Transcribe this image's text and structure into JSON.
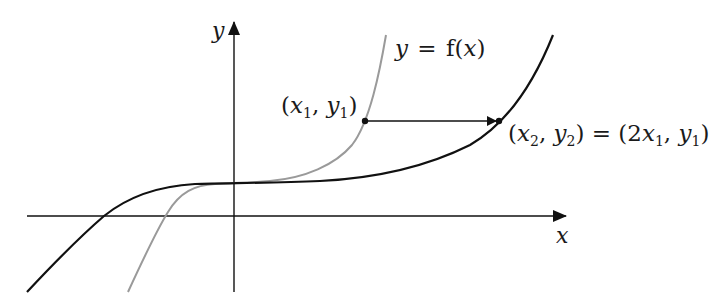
{
  "diagram": {
    "type": "function-graph",
    "axes": {
      "x_label": "x",
      "y_label": "y",
      "origin_px": [
        234,
        216
      ]
    },
    "curves": [
      {
        "name": "f(2x) curve",
        "color": "#9a9a9a",
        "label": "y = f(x)"
      },
      {
        "name": "stretched curve",
        "color": "#111111"
      }
    ],
    "annotations": {
      "curve_label": {
        "y": "y",
        "eq": "=",
        "f": "f(",
        "x": "x",
        "close": ")"
      },
      "point1": {
        "open": "(",
        "x": "x",
        "xs": "1",
        "comma": ", ",
        "y": "y",
        "ys": "1",
        "close": ")"
      },
      "point2": {
        "open": "(",
        "x": "x",
        "xs": "2",
        "comma": ", ",
        "y": "y",
        "ys": "2",
        "close": ")",
        "eq": " = ",
        "open2": "(2",
        "x2": "x",
        "x2s": "1",
        "comma2": ", ",
        "y2": "y",
        "y2s": "1",
        "close2": ")"
      }
    },
    "colors": {
      "axis": "#111111",
      "black_curve": "#111111",
      "gray_curve": "#9a9a9a"
    }
  }
}
